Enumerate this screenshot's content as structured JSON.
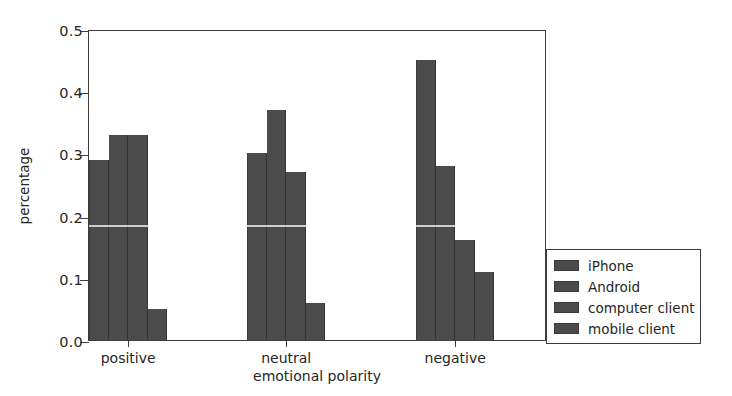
{
  "chart_data": {
    "type": "bar",
    "title": "",
    "subtitle": "",
    "xlabel": "emotional polarity",
    "ylabel": "percentage",
    "categories": [
      "positive",
      "neutral",
      "negative"
    ],
    "series": [
      {
        "name": "iPhone",
        "values": [
          0.29,
          0.3,
          0.45
        ]
      },
      {
        "name": "Android",
        "values": [
          0.33,
          0.37,
          0.28
        ]
      },
      {
        "name": "computer client",
        "values": [
          0.33,
          0.27,
          0.16
        ]
      },
      {
        "name": "mobile client",
        "values": [
          0.05,
          0.06,
          0.11
        ]
      }
    ],
    "ylim": [
      0.0,
      0.5
    ],
    "ytick_labels": [
      "0.0",
      "0.1",
      "0.2",
      "0.3",
      "0.4",
      "0.5"
    ],
    "ytick_values": [
      0.0,
      0.1,
      0.2,
      0.3,
      0.4,
      0.5
    ],
    "grid": false,
    "legend_position": "lower right, outside axes",
    "bar_color": "#4b4b4b",
    "axis_color": "#3d3d3d",
    "text_color": "#262626"
  }
}
